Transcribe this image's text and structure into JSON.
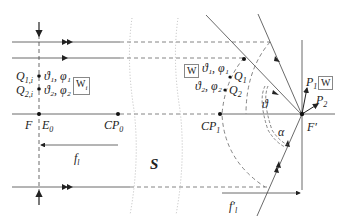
{
  "diagram": {
    "title": "",
    "left_plane": {
      "points": [
        {
          "label": "Q",
          "sub": "1,i",
          "angles": "ϑ₁, φ₁"
        },
        {
          "label": "Q",
          "sub": "2,i",
          "angles": "ϑ₂, φ₂"
        }
      ],
      "box_label": "W",
      "box_sub": "i",
      "focal_label": "F",
      "entrance_label": "E",
      "entrance_sub": "0",
      "cp_label": "CP",
      "cp_sub": "0",
      "focal_length_label": "f",
      "focal_length_sub": "l"
    },
    "middle": {
      "system_label": "S"
    },
    "right_plane": {
      "box_label": "W",
      "angles_1": "ϑ₁, φ₁",
      "angles_2": "ϑ₂, φ₂",
      "points": [
        {
          "label": "Q",
          "sub": "1"
        },
        {
          "label": "Q",
          "sub": "2"
        }
      ],
      "cp_label": "CP",
      "cp_sub": "1",
      "theta_label": "ϑ",
      "alpha_label": "α",
      "focal_label": "F′",
      "focal_length_label": "f′",
      "focal_length_sub": "l",
      "out_points": [
        {
          "label": "P",
          "sub": "1"
        },
        {
          "label": "P",
          "sub": "2"
        }
      ],
      "out_box_label": "W"
    }
  }
}
